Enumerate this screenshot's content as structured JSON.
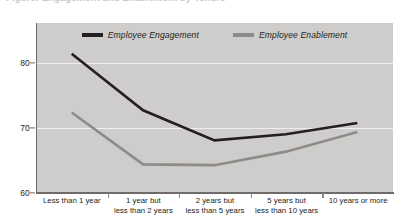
{
  "top_caption": "Figure: Engagement and Enablement by Tenure",
  "legend": {
    "position": "top-center",
    "items": [
      {
        "label": "Employee Engagement",
        "color": "#231f20",
        "icon": "line-swatch"
      },
      {
        "label": "Employee Enablement",
        "color": "#8e8c8a",
        "icon": "line-swatch"
      }
    ]
  },
  "axes": {
    "y": {
      "ticks": [
        60,
        70,
        80
      ],
      "tick_labels": [
        "60",
        "70",
        "80"
      ],
      "min": 60,
      "max": 82.6
    },
    "x": {
      "categories": [
        {
          "line1": "Less than 1 year",
          "line2": ""
        },
        {
          "line1": "1 year but",
          "line2": "less than 2 years"
        },
        {
          "line1": "2 years but",
          "line2": "less than 5 years"
        },
        {
          "line1": "5 years but",
          "line2": "less than 10 years"
        },
        {
          "line1": "10 years or more",
          "line2": ""
        }
      ]
    }
  },
  "chart_data": {
    "type": "line",
    "title": "",
    "subtitle": "",
    "xlabel": "",
    "ylabel": "",
    "ylim": [
      60,
      82.6
    ],
    "yticks": [
      60,
      70,
      80
    ],
    "grid": true,
    "legend_position": "top-center",
    "categories": [
      "Less than 1 year",
      "1 year but less than 2 years",
      "2 years but less than 5 years",
      "5 years but less than 10 years",
      "10 years or more"
    ],
    "series": [
      {
        "name": "Employee Engagement",
        "color": "#231f20",
        "values": [
          78.5,
          71.0,
          67.0,
          67.8,
          69.3
        ]
      },
      {
        "name": "Employee Enablement",
        "color": "#8e8c8a",
        "values": [
          70.7,
          63.8,
          63.7,
          65.5,
          68.1
        ]
      }
    ]
  },
  "colors": {
    "page_background": "#ffffff",
    "plot_background": "#cfcdcb",
    "gridline": "#efeeed",
    "axis_line": "#6e6c6a",
    "text": "#231f20",
    "series_dark": "#231f20",
    "series_gray": "#8e8c8a"
  }
}
